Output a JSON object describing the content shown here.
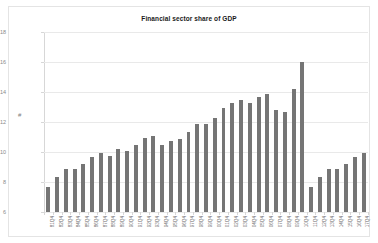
{
  "chart_data": {
    "type": "bar",
    "title": "Financial sector share of GDP",
    "xlabel": "",
    "ylabel": "#",
    "ylim": [
      6,
      18
    ],
    "yticks": [
      6,
      8,
      10,
      12,
      14,
      16,
      18
    ],
    "grid": true,
    "legend": "none",
    "bar_color": "#757575",
    "categories": [
      "81Q4",
      "82Q4",
      "83Q4",
      "84Q4",
      "85Q4",
      "86Q4",
      "87Q4",
      "88Q4",
      "89Q4",
      "90Q4",
      "91Q4",
      "92Q4",
      "93Q4",
      "94Q4",
      "95Q4",
      "96Q4",
      "97Q4",
      "98Q4",
      "99Q4",
      "00Q4",
      "01Q4",
      "02Q4",
      "03Q4",
      "04Q4",
      "05Q4",
      "06Q4",
      "07Q4",
      "08Q4",
      "09Q4",
      "10Q4",
      "11Q4",
      "12Q4",
      "13Q4",
      "14Q4",
      "15Q4",
      "16Q4",
      "17Q4"
    ],
    "values": [
      7.7,
      8.35,
      8.85,
      8.85,
      9.2,
      9.7,
      9.95,
      9.75,
      10.2,
      10.1,
      10.45,
      10.95,
      11.1,
      10.5,
      10.75,
      10.9,
      11.35,
      11.9,
      11.9,
      12.25,
      12.95,
      13.3,
      13.5,
      13.25,
      13.65,
      13.85,
      12.8,
      12.65,
      14.2,
      16.0,
      7.7,
      8.35,
      8.85,
      8.85,
      9.2,
      9.7,
      9.95
    ]
  }
}
